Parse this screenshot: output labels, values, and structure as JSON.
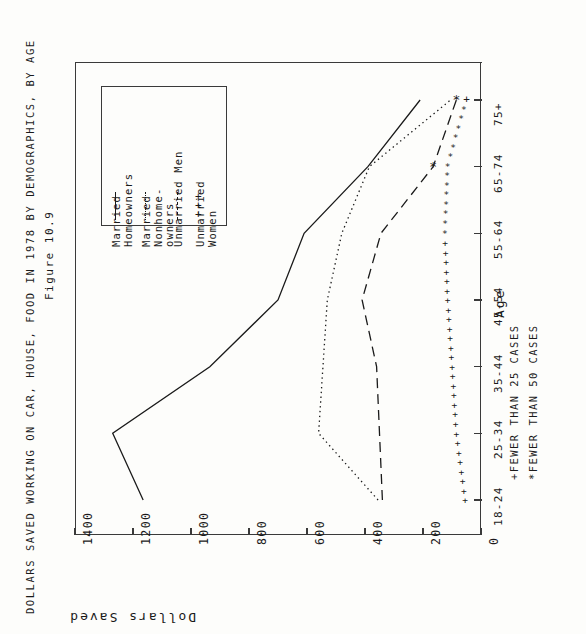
{
  "figure": {
    "number": "Figure 10.9",
    "title": "DOLLARS SAVED WORKING ON CAR, HOUSE, FOOD IN 1978 BY DEMOGRAPHICS, BY AGE"
  },
  "footnotes": {
    "plus": "+FEWER THAN 25 CASES",
    "star": "*FEWER THAN 50 CASES"
  },
  "legend": {
    "items": [
      {
        "label": "Married\nHomeowners",
        "marker": "solid"
      },
      {
        "label": "Married\nNonhome-\nowners",
        "marker": "dotted"
      },
      {
        "label": "Unmarried Men",
        "marker": "dashed"
      },
      {
        "label": "Unmarried\nWomen",
        "marker": "plus"
      }
    ]
  },
  "chart_data": {
    "type": "line",
    "title": "DOLLARS SAVED WORKING ON CAR, HOUSE, FOOD IN 1978 BY DEMOGRAPHICS, BY AGE",
    "subtitle": "Figure 10.9",
    "xlabel": "Age",
    "ylabel": "Dollars Saved",
    "orientation": "rotated-90-clockwise",
    "categories": [
      "18-24",
      "25-34",
      "35-44",
      "45-54",
      "55-64",
      "65-74",
      "75+"
    ],
    "ylim": [
      0,
      1400
    ],
    "yticks": [
      0,
      200,
      400,
      600,
      800,
      1000,
      1200,
      1400
    ],
    "grid": false,
    "legend_position": "upper-left",
    "series": [
      {
        "name": "Married Homeowners",
        "style": "solid",
        "values": [
          1165,
          1270,
          935,
          700,
          610,
          390,
          210
        ],
        "annotations": []
      },
      {
        "name": "Married Nonhomeowners",
        "style": "dotted",
        "values": [
          355,
          560,
          545,
          530,
          480,
          385,
          105
        ],
        "annotations": []
      },
      {
        "name": "Unmarried Men",
        "style": "dashed",
        "values": [
          340,
          350,
          360,
          410,
          345,
          165,
          85
        ],
        "annotations": [
          {
            "category": "65-74",
            "symbol": "*"
          },
          {
            "category": "75+",
            "symbol": "*"
          }
        ]
      },
      {
        "name": "Unmarried Women",
        "style": "plus-markers",
        "values": [
          55,
          85,
          100,
          115,
          125,
          115,
          50
        ],
        "annotations": [
          {
            "category": "75+",
            "symbol": "+"
          }
        ]
      }
    ]
  },
  "colors": {
    "ink": "#1a1a1a",
    "axis": "#3a3a3a",
    "background": "#fdfdfb"
  }
}
